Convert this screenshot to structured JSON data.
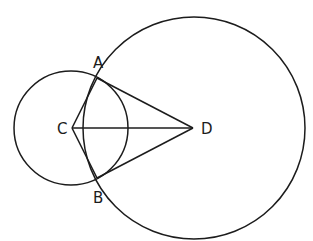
{
  "diagram": {
    "background": "#ffffff",
    "stroke_color": "#1c1c1c",
    "circles": [
      {
        "name": "circle-c",
        "cx": 71,
        "cy": 128,
        "r": 57
      },
      {
        "name": "circle-d",
        "cx": 194,
        "cy": 128,
        "r": 111
      }
    ],
    "points": {
      "A": {
        "x": 97,
        "y": 78,
        "label": "A",
        "lx": 93,
        "ly": 68
      },
      "B": {
        "x": 97,
        "y": 178,
        "label": "B",
        "lx": 93,
        "ly": 203
      },
      "C": {
        "x": 72,
        "y": 128,
        "label": "C",
        "lx": 57,
        "ly": 134
      },
      "D": {
        "x": 193,
        "y": 128,
        "label": "D",
        "lx": 201,
        "ly": 134
      }
    },
    "segments": [
      [
        "C",
        "A"
      ],
      [
        "C",
        "B"
      ],
      [
        "C",
        "D"
      ],
      [
        "A",
        "D"
      ],
      [
        "B",
        "D"
      ]
    ]
  }
}
